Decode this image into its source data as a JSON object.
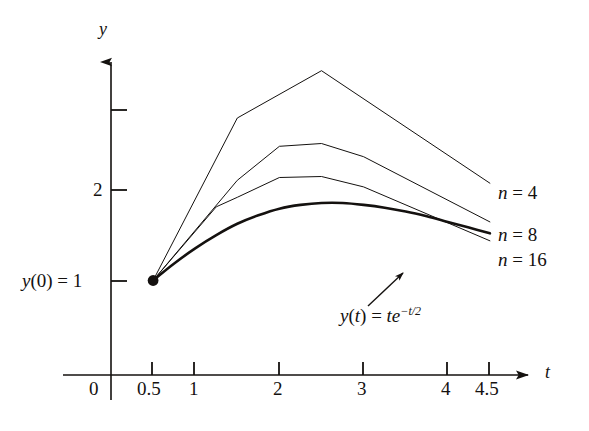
{
  "figure": {
    "axes": {
      "x_axis_name": "t",
      "y_axis_name": "y",
      "origin_label": "0"
    },
    "x_ticks": [
      {
        "value": 0.5,
        "label": "0.5"
      },
      {
        "value": 1,
        "label": "1"
      },
      {
        "value": 2,
        "label": "2"
      },
      {
        "value": 3,
        "label": "3"
      },
      {
        "value": 4,
        "label": "4"
      },
      {
        "value": 4.5,
        "label": "4.5"
      }
    ],
    "y_ticks": [
      {
        "value": 1,
        "label": "y(0) = 1"
      },
      {
        "value": 2,
        "label": "2"
      },
      {
        "value": 3,
        "label": ""
      }
    ],
    "y_initial_label": {
      "y": "y",
      "open": "(",
      "zero": "0",
      "close": ")",
      "equals": " = ",
      "one": "1"
    },
    "series_labels": [
      {
        "name": "n",
        "equals": " = ",
        "value": "4"
      },
      {
        "name": "n",
        "equals": " = ",
        "value": "8"
      },
      {
        "name": "n",
        "equals": " = ",
        "value": "16"
      }
    ],
    "exact_label": {
      "y": "y",
      "open": "(",
      "t": "t",
      "close": ")",
      "equals": " = ",
      "te": "te",
      "exponent": "−t/2",
      "full": "y(t) = te^(-t/2)"
    },
    "colors": {
      "ink": "#14110f",
      "background": "#ffffff"
    }
  },
  "chart_data": {
    "type": "line",
    "title": "",
    "xlabel": "t",
    "ylabel": "y",
    "xlim": [
      0,
      4.9
    ],
    "ylim": [
      0,
      3.45
    ],
    "grid": false,
    "legend": "inline-right-end-of-curve",
    "initial_point": {
      "t": 0.5,
      "y": 1.0,
      "label": "y(0) = 1"
    },
    "series": [
      {
        "name": "n = 4",
        "style": "piecewise-linear",
        "linewidth": 1,
        "x": [
          0.5,
          1.5,
          2.5,
          4.5
        ],
        "y": [
          1.0,
          2.72,
          3.22,
          2.03
        ]
      },
      {
        "name": "n = 8",
        "style": "piecewise-linear",
        "linewidth": 1,
        "x": [
          0.5,
          1.5,
          2.0,
          2.5,
          3.0,
          4.5
        ],
        "y": [
          1.0,
          2.06,
          2.42,
          2.45,
          2.31,
          1.62
        ]
      },
      {
        "name": "n = 16",
        "style": "piecewise-linear",
        "linewidth": 1,
        "x": [
          0.5,
          1.25,
          1.5,
          2.0,
          2.5,
          3.0,
          4.5
        ],
        "y": [
          1.0,
          1.78,
          1.88,
          2.09,
          2.1,
          1.99,
          1.42
        ]
      },
      {
        "name": "y(t) = te^(-t/2)",
        "style": "smooth-exact",
        "linewidth": 2.6,
        "x": [
          0.5,
          0.75,
          1.0,
          1.25,
          1.5,
          1.75,
          2.0,
          2.25,
          2.5,
          2.75,
          3.0,
          3.25,
          3.5,
          3.75,
          4.0,
          4.25,
          4.5
        ],
        "y": [
          1.0,
          1.18,
          1.34,
          1.48,
          1.6,
          1.69,
          1.76,
          1.8,
          1.82,
          1.82,
          1.8,
          1.77,
          1.73,
          1.68,
          1.62,
          1.56,
          1.5
        ]
      }
    ]
  }
}
